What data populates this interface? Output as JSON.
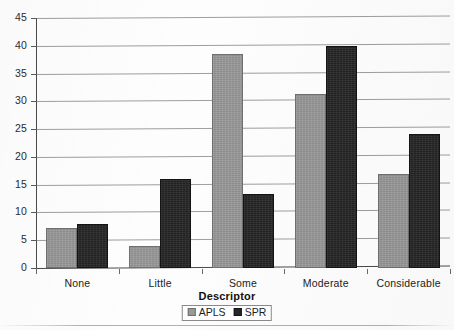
{
  "chart_data": {
    "type": "bar",
    "title": "",
    "xlabel": "Descriptor",
    "ylabel": "",
    "categories": [
      "None",
      "Little",
      "Some",
      "Moderate",
      "Considerable"
    ],
    "series": [
      {
        "name": "APLS",
        "color": "#9a9a9a",
        "values": [
          7.2,
          3.9,
          38.6,
          31.3,
          17.0
        ]
      },
      {
        "name": "SPR",
        "color": "#262626",
        "values": [
          7.9,
          16.0,
          13.4,
          40.0,
          24.2
        ]
      }
    ],
    "ylim": [
      0,
      45
    ],
    "ytick_step": 5,
    "yticks": [
      "0",
      "5",
      "10",
      "15",
      "20",
      "25",
      "30",
      "35",
      "40",
      "45"
    ],
    "grid": true,
    "legend_position": "bottom"
  },
  "legend": {
    "items": [
      {
        "label": "APLS",
        "swatch": "apls-swatch"
      },
      {
        "label": "SPR",
        "swatch": "spr-swatch"
      }
    ]
  },
  "axis": {
    "x_title": "Descriptor"
  },
  "page": {
    "title_ghost": ""
  }
}
